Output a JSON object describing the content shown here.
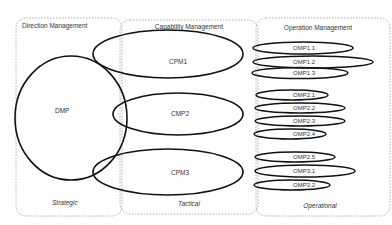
{
  "regions": [
    {
      "id": "direction",
      "title": "Direction Management",
      "level": "Strategic"
    },
    {
      "id": "capability",
      "title": "Capability Management",
      "level": "Tactical"
    },
    {
      "id": "operation",
      "title": "Operation Management",
      "level": "Operational"
    }
  ],
  "direction_node": {
    "label": "DMP"
  },
  "capability_nodes": [
    {
      "label": "CPM1"
    },
    {
      "label": "CMP2"
    },
    {
      "label": "CPM3"
    }
  ],
  "operation_nodes": [
    {
      "label": "OMP1.1"
    },
    {
      "label": "OMP1.2"
    },
    {
      "label": "OMP1.3"
    },
    {
      "label": "OMP2.1"
    },
    {
      "label": "OMP2.2"
    },
    {
      "label": "OMP2.3"
    },
    {
      "label": "OMP2.4"
    },
    {
      "label": "OMP2.5"
    },
    {
      "label": "OMP3.1"
    },
    {
      "label": "OMP3.2"
    }
  ],
  "colors": {
    "stroke": "#111111",
    "dashed": "#9a9a9a",
    "text": "#333333"
  }
}
